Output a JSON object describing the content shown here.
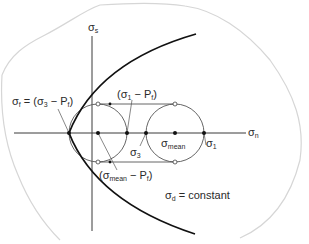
{
  "figure": {
    "type": "Mohr circle diagram",
    "axes": {
      "horizontal": {
        "symbol": "σ",
        "subscript": "n"
      },
      "vertical": {
        "symbol": "σ",
        "subscript": "s"
      }
    },
    "labels": {
      "failure_point": {
        "main": "σ",
        "sub": "f",
        "rest": " = (σ",
        "sub2": "3",
        "rest2": " − P",
        "sub3": "f",
        "close": ")"
      },
      "shifted_max": {
        "open": "(σ",
        "sub": "1",
        "rest": " − P",
        "sub2": "f",
        "close": ")"
      },
      "shifted_mean": {
        "open": "(σ",
        "sub": "mean",
        "rest": " − P",
        "sub2": "f",
        "close": ")"
      },
      "sigma3": {
        "main": "σ",
        "sub": "3"
      },
      "sigma_mean": {
        "main": "σ",
        "sub": "mean"
      },
      "sigma1": {
        "main": "σ",
        "sub": "1"
      },
      "differential": {
        "main": "σ",
        "sub": "d",
        "rest": " = constant"
      }
    },
    "colors": {
      "line": "#3a3a3a",
      "envelope": "#111111",
      "outline": "#cfcfcf"
    }
  }
}
